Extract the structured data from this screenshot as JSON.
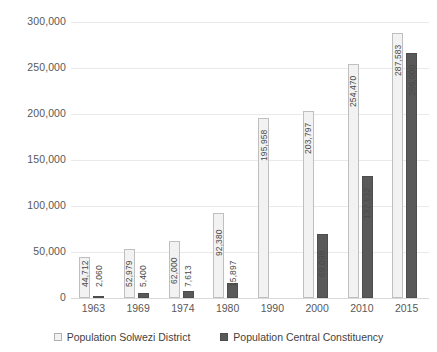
{
  "chart_data": {
    "type": "bar",
    "title": "",
    "subtitle": "",
    "xlabel": "",
    "ylabel": "",
    "categories": [
      "1963",
      "1969",
      "1974",
      "1980",
      "1990",
      "2000",
      "2010",
      "2015"
    ],
    "series": [
      {
        "name": "Population Solwezi District",
        "color": "#f2f2f2",
        "border_color": "#bfbfbf",
        "values": [
          44712,
          52979,
          62000,
          92380,
          195958,
          203797,
          254470,
          287583
        ],
        "labels": [
          "44,712",
          "52,979",
          "62,000",
          "92,380",
          "195,958",
          "203,797",
          "254,470",
          "287,583"
        ]
      },
      {
        "name": "Population Central Constituency",
        "color": "#595959",
        "border_color": "#4d4d4d",
        "values": [
          2060,
          5400,
          7613,
          15897,
          null,
          69098,
          132532,
          266000
        ],
        "labels": [
          "2,060",
          "5,400",
          "7,613",
          "15,897",
          "",
          "69,098",
          "132,532",
          "266,000"
        ]
      }
    ],
    "ylim": [
      0,
      300000
    ],
    "y_ticks": [
      0,
      50000,
      100000,
      150000,
      200000,
      250000,
      300000
    ],
    "y_tick_labels": [
      "0",
      "50,000",
      "100,000",
      "150,000",
      "200,000",
      "250,000",
      "300,000"
    ],
    "grid": true,
    "legend_position": "bottom",
    "data_labels": true,
    "data_label_rotation": -90
  },
  "legend": {
    "items": [
      {
        "label": "Population Solwezi District",
        "swatch": "light-square-icon"
      },
      {
        "label": "Population Central Constituency",
        "swatch": "dark-square-icon"
      }
    ]
  }
}
